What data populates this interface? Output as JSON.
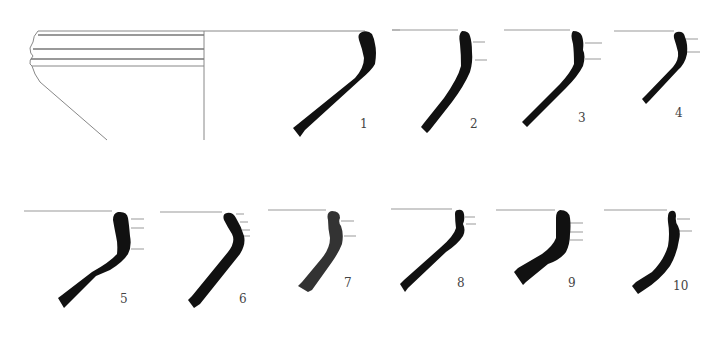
{
  "figure": {
    "type": "pottery rim profile drawings",
    "colors": {
      "profile_fill": "#111111",
      "line": "#888888",
      "background": "#ffffff"
    },
    "profiles": [
      {
        "id": "1",
        "label": "1"
      },
      {
        "id": "2",
        "label": "2"
      },
      {
        "id": "3",
        "label": "3"
      },
      {
        "id": "4",
        "label": "4"
      },
      {
        "id": "5",
        "label": "5"
      },
      {
        "id": "6",
        "label": "6"
      },
      {
        "id": "7",
        "label": "7"
      },
      {
        "id": "8",
        "label": "8"
      },
      {
        "id": "9",
        "label": "9"
      },
      {
        "id": "10",
        "label": "10"
      }
    ]
  }
}
